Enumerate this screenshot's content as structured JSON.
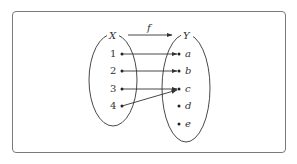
{
  "diagram": {
    "type": "function-mapping",
    "domain_set": {
      "label": "X",
      "elements": [
        "1",
        "2",
        "3",
        "4"
      ]
    },
    "codomain_set": {
      "label": "Y",
      "elements": [
        "a",
        "b",
        "c",
        "d",
        "e"
      ]
    },
    "function_label": "f",
    "mappings": [
      {
        "from": "1",
        "to": "a"
      },
      {
        "from": "2",
        "to": "b"
      },
      {
        "from": "3",
        "to": "c"
      },
      {
        "from": "4",
        "to": "c"
      }
    ],
    "colors": {
      "stroke": "#333333",
      "frame": "#7a7a7a"
    }
  }
}
